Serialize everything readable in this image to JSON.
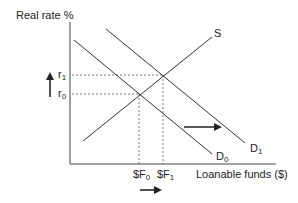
{
  "diagram": {
    "y_axis_label": "Real rate %",
    "x_axis_label": "Loanable funds ($)",
    "rate_labels": [
      {
        "base": "r",
        "sub": "1"
      },
      {
        "base": "r",
        "sub": "0"
      }
    ],
    "quantity_labels": [
      {
        "base": "$F",
        "sub": "0"
      },
      {
        "base": "$F",
        "sub": "1"
      }
    ],
    "curves": {
      "supply": {
        "label": "S"
      },
      "demand_initial": {
        "base": "D",
        "sub": "0"
      },
      "demand_shifted": {
        "base": "D",
        "sub": "1"
      }
    },
    "annotations": {
      "rate_arrow": "up",
      "demand_shift_arrow": "right",
      "quantity_arrow": "right"
    }
  }
}
